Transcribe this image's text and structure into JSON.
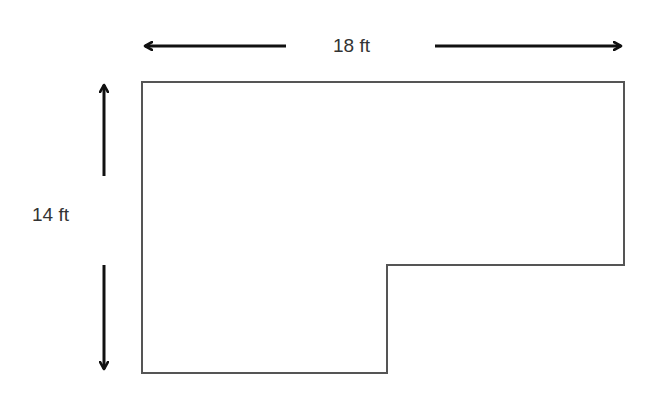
{
  "diagram": {
    "type": "floor-plan-dimensions",
    "shape": "L-shaped room outline",
    "width_label": "18 ft",
    "height_label": "14 ft",
    "colors": {
      "outline": "#555555",
      "arrow": "#111111",
      "text": "#333333",
      "background": "#ffffff"
    },
    "outline_points": [
      [
        142,
        82
      ],
      [
        624,
        82
      ],
      [
        624,
        265
      ],
      [
        387,
        265
      ],
      [
        387,
        373
      ],
      [
        142,
        373
      ]
    ],
    "arrows": {
      "horizontal_left": {
        "from": [
          286,
          46
        ],
        "to": [
          143,
          46
        ]
      },
      "horizontal_right": {
        "from": [
          435,
          46
        ],
        "to": [
          623,
          46
        ]
      },
      "vertical_up": {
        "from": [
          104,
          176
        ],
        "to": [
          104,
          83
        ]
      },
      "vertical_down": {
        "from": [
          104,
          265
        ],
        "to": [
          104,
          371
        ]
      }
    }
  }
}
